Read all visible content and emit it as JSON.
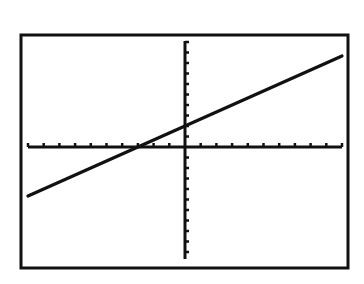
{
  "chart_data": {
    "type": "line",
    "title": "",
    "xlabel": "",
    "ylabel": "",
    "xlim": [
      -10,
      10
    ],
    "ylim": [
      -10,
      10
    ],
    "xscl": 1,
    "yscl": 1,
    "grid": false,
    "axes_visible": true,
    "legend": null,
    "series": [
      {
        "name": "y = (2/3)x + 2",
        "equation": "y=(2/3)x+2",
        "slope": 0.6667,
        "intercept": 2,
        "x": [
          -10,
          -3,
          0,
          10
        ],
        "y": [
          -4.67,
          0,
          2,
          8.67
        ]
      }
    ],
    "annotations": []
  },
  "style": {
    "frame_color": "#111111",
    "axis_color": "#111111",
    "line_color": "#111111",
    "background": "#ffffff"
  }
}
